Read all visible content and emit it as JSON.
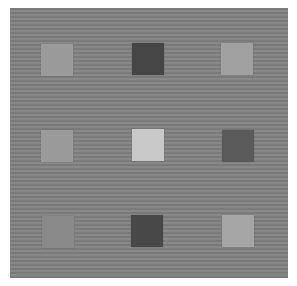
{
  "stimulus": {
    "background": {
      "color": "#808080",
      "stripe_light": "#888888",
      "stripe_dark": "#7a7a7a",
      "stripe_period_px": 4
    },
    "grid": {
      "rows": 3,
      "cols": 3,
      "squares": [
        {
          "row": 0,
          "col": 0,
          "color": "#9a9a9a",
          "x": 41,
          "y": 44
        },
        {
          "row": 0,
          "col": 1,
          "color": "#454545",
          "x": 132,
          "y": 43
        },
        {
          "row": 0,
          "col": 2,
          "color": "#a0a0a0",
          "x": 221,
          "y": 43
        },
        {
          "row": 1,
          "col": 0,
          "color": "#9a9a9a",
          "x": 41,
          "y": 130
        },
        {
          "row": 1,
          "col": 1,
          "color": "#c8c8c8",
          "x": 132,
          "y": 129
        },
        {
          "row": 1,
          "col": 2,
          "color": "#5a5a5a",
          "x": 222,
          "y": 130
        },
        {
          "row": 2,
          "col": 0,
          "color": "#8a8a8a",
          "x": 42,
          "y": 216
        },
        {
          "row": 2,
          "col": 1,
          "color": "#484848",
          "x": 131,
          "y": 215
        },
        {
          "row": 2,
          "col": 2,
          "color": "#a5a5a5",
          "x": 222,
          "y": 215
        }
      ]
    }
  }
}
